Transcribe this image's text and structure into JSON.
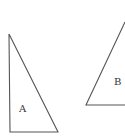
{
  "diagram": {
    "type": "geometry-triangles",
    "shapes": [
      {
        "id": "A",
        "label": "A",
        "kind": "right-triangle",
        "points": [
          [
            9,
            34
          ],
          [
            10,
            132
          ],
          [
            58,
            132
          ]
        ],
        "label_pos": [
          19,
          112
        ]
      },
      {
        "id": "B",
        "label": "B",
        "kind": "triangle",
        "points": [
          [
            125,
            22
          ],
          [
            86,
            105
          ],
          [
            125,
            105
          ]
        ],
        "label_pos": [
          114,
          85
        ]
      }
    ],
    "colors": {
      "stroke": "#555555",
      "label": "#333333",
      "background": "#ffffff"
    }
  }
}
